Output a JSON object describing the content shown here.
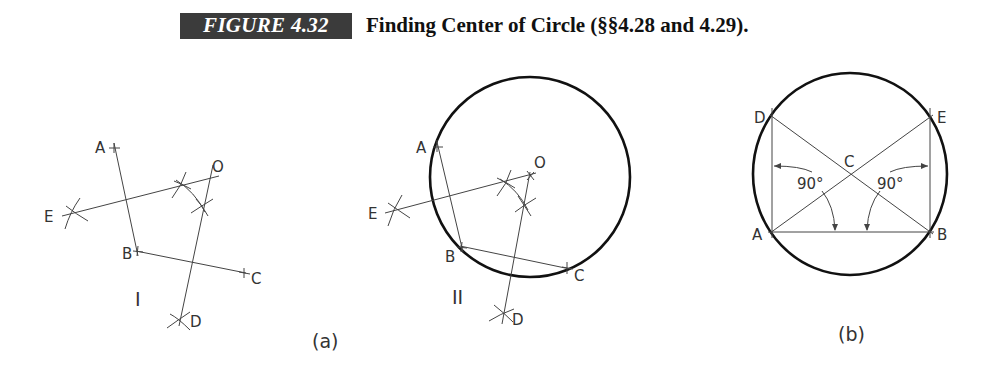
{
  "caption": {
    "figure_label": "FIGURE 4.32",
    "title": "Finding Center of Circle (§§4.28 and 4.29)."
  },
  "figure_a": {
    "sublabel": "(a)",
    "step_I": {
      "roman": "I",
      "points": {
        "A": "A",
        "B": "B",
        "C": "C",
        "D": "D",
        "E": "E",
        "O": "O"
      }
    },
    "step_II": {
      "roman": "II",
      "points": {
        "A": "A",
        "B": "B",
        "C": "C",
        "D": "D",
        "E": "E",
        "O": "O"
      }
    }
  },
  "figure_b": {
    "sublabel": "(b)",
    "points": {
      "A": "A",
      "B": "B",
      "C": "C",
      "D": "D",
      "E": "E"
    },
    "angle_left": "90°",
    "angle_right": "90°"
  }
}
